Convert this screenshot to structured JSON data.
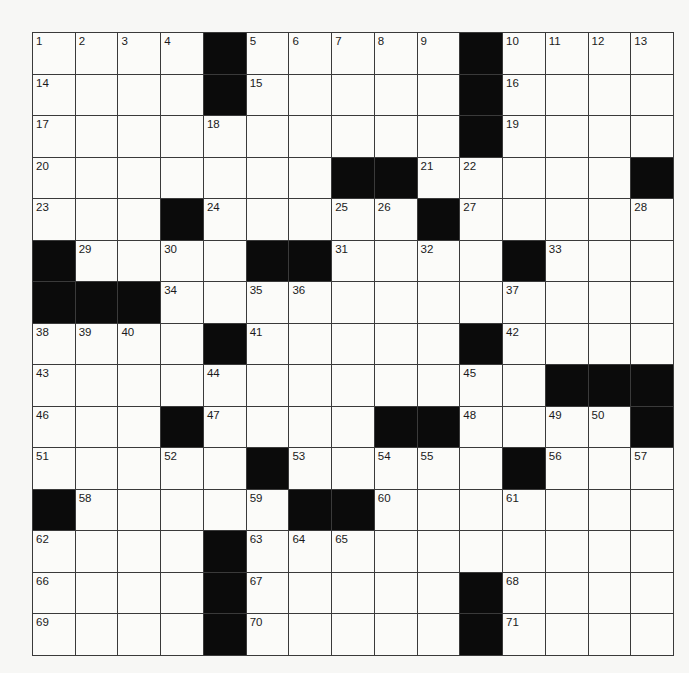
{
  "puzzle": {
    "rows": 15,
    "cols": 15,
    "colors": {
      "block": "#0b0b0b",
      "cell": "#fbfbf9",
      "line": "#3a3a3a"
    },
    "grid": [
      [
        "1",
        "2",
        "3",
        "4",
        "#",
        "5",
        "6",
        "7",
        "8",
        "9",
        "#",
        "10",
        "11",
        "12",
        "13"
      ],
      [
        "14",
        ".",
        ".",
        ".",
        "#",
        "15",
        ".",
        ".",
        ".",
        ".",
        "#",
        "16",
        ".",
        ".",
        "."
      ],
      [
        "17",
        ".",
        ".",
        ".",
        "18",
        ".",
        ".",
        ".",
        ".",
        ".",
        "#",
        "19",
        ".",
        ".",
        "."
      ],
      [
        "20",
        ".",
        ".",
        ".",
        ".",
        ".",
        ".",
        "#",
        "#",
        "21",
        "22",
        ".",
        ".",
        ".",
        "#"
      ],
      [
        "23",
        ".",
        ".",
        "#",
        "24",
        ".",
        ".",
        "25",
        "26",
        "#",
        "27",
        ".",
        ".",
        ".",
        "28"
      ],
      [
        "#",
        "29",
        ".",
        "30",
        ".",
        "#",
        "#",
        "31",
        ".",
        "32",
        ".",
        "#",
        "33",
        ".",
        "."
      ],
      [
        "#",
        "#",
        "#",
        "34",
        ".",
        "35",
        "36",
        ".",
        ".",
        ".",
        ".",
        "37",
        ".",
        ".",
        "."
      ],
      [
        "38",
        "39",
        "40",
        ".",
        "#",
        "41",
        ".",
        ".",
        ".",
        ".",
        "#",
        "42",
        ".",
        ".",
        "."
      ],
      [
        "43",
        ".",
        ".",
        ".",
        "44",
        ".",
        ".",
        ".",
        ".",
        ".",
        "45",
        ".",
        "#",
        "#",
        "#"
      ],
      [
        "46",
        ".",
        ".",
        "#",
        "47",
        ".",
        ".",
        ".",
        "#",
        "#",
        "48",
        ".",
        "49",
        "50",
        "#"
      ],
      [
        "51",
        ".",
        ".",
        "52",
        ".",
        "#",
        "53",
        ".",
        "54",
        "55",
        ".",
        "#",
        "56",
        ".",
        "57"
      ],
      [
        "#",
        "58",
        ".",
        ".",
        ".",
        "59",
        "#",
        "#",
        "60",
        ".",
        ".",
        "61",
        ".",
        ".",
        "."
      ],
      [
        "62",
        ".",
        ".",
        ".",
        "#",
        "63",
        "64",
        "65",
        ".",
        ".",
        ".",
        ".",
        ".",
        ".",
        "."
      ],
      [
        "66",
        ".",
        ".",
        ".",
        "#",
        "67",
        ".",
        ".",
        ".",
        ".",
        "#",
        "68",
        ".",
        ".",
        "."
      ],
      [
        "69",
        ".",
        ".",
        ".",
        "#",
        "70",
        ".",
        ".",
        ".",
        ".",
        "#",
        "71",
        ".",
        ".",
        "."
      ]
    ]
  }
}
